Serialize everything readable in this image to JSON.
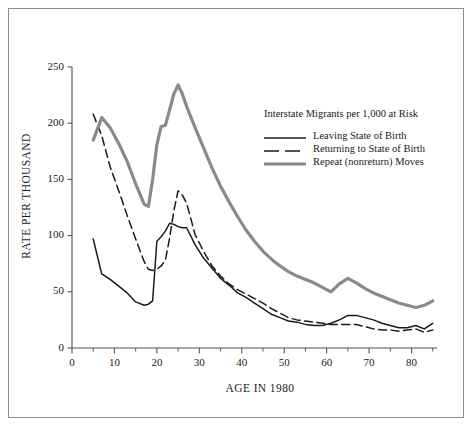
{
  "chart_data": {
    "type": "line",
    "title": "",
    "legend_title": "Interstate Migrants per 1,000 at Risk",
    "xlabel": "AGE IN 1980",
    "ylabel": "RATE PER THOUSAND",
    "xlim": [
      0,
      86
    ],
    "ylim": [
      0,
      250
    ],
    "xticks": [
      0,
      10,
      20,
      30,
      40,
      50,
      60,
      70,
      80
    ],
    "xticks_minor": [
      5,
      15,
      25,
      35,
      45,
      55,
      65,
      75,
      85
    ],
    "yticks": [
      0,
      50,
      100,
      150,
      200,
      250
    ],
    "grid": false,
    "legend_position": "upper-right-inside",
    "x": [
      5,
      7,
      9,
      11,
      13,
      15,
      17,
      18,
      19,
      20,
      21,
      22,
      23,
      24,
      25,
      26,
      27,
      29,
      31,
      33,
      35,
      37,
      39,
      41,
      43,
      45,
      47,
      49,
      51,
      53,
      55,
      57,
      59,
      61,
      63,
      65,
      67,
      69,
      71,
      73,
      75,
      77,
      79,
      81,
      83,
      85
    ],
    "series": [
      {
        "name": "Leaving State of Birth",
        "style": "solid",
        "color": "#1a1a1a",
        "values": [
          97,
          66,
          61,
          55,
          49,
          41,
          38,
          39,
          42,
          95,
          99,
          104,
          111,
          110,
          108,
          107,
          107,
          92,
          80,
          71,
          62,
          56,
          49,
          45,
          40,
          35,
          30,
          27,
          24,
          23,
          21,
          20,
          20,
          22,
          25,
          29,
          29,
          27,
          25,
          22,
          20,
          18,
          18,
          20,
          17,
          22
        ]
      },
      {
        "name": "Returning to State of Birth",
        "style": "dashed",
        "color": "#1a1a1a",
        "values": [
          208,
          189,
          161,
          140,
          118,
          97,
          77,
          70,
          69,
          70,
          73,
          78,
          98,
          122,
          140,
          136,
          129,
          101,
          86,
          73,
          64,
          57,
          52,
          48,
          44,
          40,
          35,
          31,
          27,
          25,
          24,
          23,
          22,
          21,
          21,
          21,
          21,
          19,
          17,
          16,
          16,
          15,
          16,
          17,
          14,
          16
        ]
      },
      {
        "name": "Repeat (nonreturn) Moves",
        "style": "thick-gray",
        "color": "#8a8a8a",
        "values": [
          185,
          205,
          196,
          182,
          166,
          146,
          128,
          126,
          150,
          181,
          197,
          198,
          212,
          226,
          234,
          226,
          215,
          196,
          178,
          160,
          144,
          130,
          117,
          105,
          95,
          86,
          79,
          73,
          68,
          64,
          61,
          58,
          54,
          50,
          57,
          62,
          58,
          53,
          49,
          46,
          43,
          40,
          38,
          36,
          38,
          42
        ]
      }
    ]
  },
  "legend": {
    "title": "Interstate Migrants per 1,000 at Risk",
    "items": [
      {
        "label": "Leaving State of Birth"
      },
      {
        "label": "Returning to State of Birth"
      },
      {
        "label": "Repeat (nonreturn) Moves"
      }
    ]
  },
  "axes": {
    "ylabel": "RATE PER THOUSAND",
    "xlabel": "AGE IN 1980",
    "ytick_labels": [
      "0",
      "50",
      "100",
      "150",
      "200",
      "250"
    ],
    "xtick_labels": [
      "0",
      "10",
      "20",
      "30",
      "40",
      "50",
      "60",
      "70",
      "80"
    ]
  },
  "colors": {
    "line_black": "#1a1a1a",
    "line_gray": "#8a8a8a",
    "axis": "#555555",
    "frame": "#8c8c8c",
    "background": "#ffffff"
  }
}
